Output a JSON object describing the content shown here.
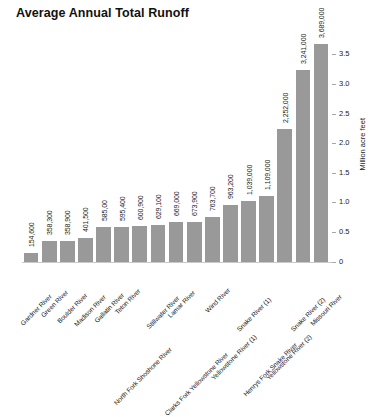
{
  "chart_data": {
    "type": "bar",
    "title": "Average Annual Total Runoff",
    "xlabel": "",
    "ylabel": "Million acre feet",
    "ylim": [
      0,
      3.75
    ],
    "grid": false,
    "legend": "none",
    "y_axis_position": "right",
    "y_ticks": [
      0,
      0.5,
      1.0,
      1.5,
      2.0,
      2.5,
      3.0,
      3.5
    ],
    "y_tick_labels": [
      "0",
      "0.5",
      "1.0",
      "1.5",
      "2.0",
      "2.5",
      "3.0",
      "3.5"
    ],
    "units": "acre feet",
    "bar_color": "#999999",
    "categories": [
      "Gardner River",
      "Green River",
      "Boulder River",
      "Madison River",
      "Gallatin River",
      "Teton River",
      "North Fork Shoshone River",
      "Stillwater River",
      "Lamar River",
      "Clarks Fork Yellowstone River",
      "Wind River",
      "Yellowstone River (1)",
      "Snake River (1)",
      "Henrys Fork Snake River",
      "Yellowstone River (2)",
      "Snake River (2)",
      "Missouri River"
    ],
    "values": [
      154600,
      358300,
      358900,
      401500,
      585000,
      595400,
      600900,
      629100,
      669000,
      673900,
      763700,
      963200,
      1039000,
      1109000,
      2252000,
      3241000,
      3689000
    ],
    "data_labels": [
      "154,600",
      "358,300",
      "358,900",
      "401,500",
      "585,00",
      "595,400",
      "600,900",
      "629,100",
      "669,000",
      "673,900",
      "763,700",
      "963,200",
      "1,039,000",
      "1,109,000",
      "2,252,000",
      "3,241,000",
      "3,689,000"
    ]
  }
}
